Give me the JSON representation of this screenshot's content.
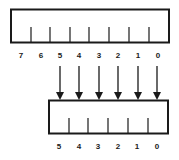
{
  "diagram": {
    "colors": {
      "stroke": "#1a1a1a",
      "background": "#ffffff"
    },
    "top_register": {
      "bit_labels": [
        "7",
        "6",
        "5",
        "4",
        "3",
        "2",
        "1",
        "0"
      ]
    },
    "bottom_register": {
      "bit_labels": [
        "5",
        "4",
        "3",
        "2",
        "1",
        "0"
      ]
    },
    "arrows": [
      {
        "from": "5",
        "to": "5"
      },
      {
        "from": "4",
        "to": "4"
      },
      {
        "from": "3",
        "to": "3"
      },
      {
        "from": "2",
        "to": "2"
      },
      {
        "from": "1",
        "to": "1"
      },
      {
        "from": "0",
        "to": "0"
      }
    ]
  }
}
